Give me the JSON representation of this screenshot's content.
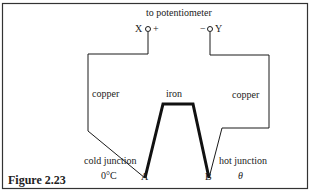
{
  "figure": {
    "caption": "Figure 2.23",
    "title_label": "to potentiometer",
    "terminals": {
      "left": {
        "name": "X",
        "polarity": "+"
      },
      "right": {
        "name": "Y",
        "polarity": "−"
      }
    },
    "wires": {
      "left": "copper",
      "middle": "iron",
      "right": "copper"
    },
    "junctions": {
      "A": {
        "point": "A",
        "label": "cold junction",
        "temp": "0°C"
      },
      "B": {
        "point": "B",
        "label": "hot junction",
        "temp": "θ"
      }
    },
    "colors": {
      "line": "#1a1a1a",
      "background": "#ffffff",
      "border": "#333333"
    }
  }
}
